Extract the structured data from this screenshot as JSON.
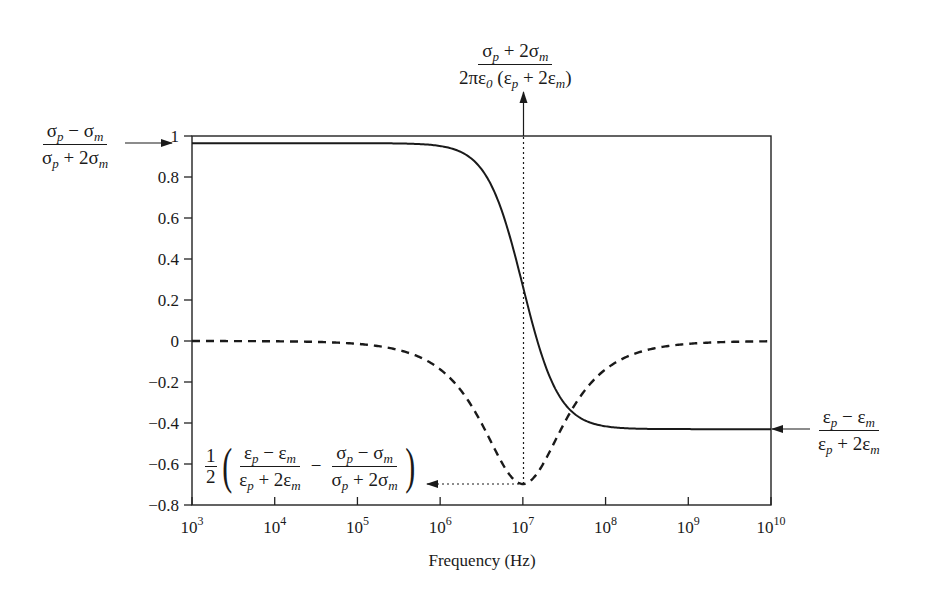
{
  "chart_data": {
    "type": "line",
    "title": "",
    "xlabel": "Frequency (Hz)",
    "ylabel": "",
    "xscale": "log",
    "xlim": [
      1000,
      10000000000
    ],
    "ylim": [
      -0.8,
      1.0
    ],
    "grid": false,
    "legend": null,
    "x_ticks": [
      "10^3",
      "10^4",
      "10^5",
      "10^6",
      "10^7",
      "10^8",
      "10^9",
      "10^10"
    ],
    "y_ticks": [
      "1",
      "0.8",
      "0.6",
      "0.4",
      "0.2",
      "0",
      "-0.2",
      "-0.4",
      "-0.6",
      "-0.8"
    ],
    "series": [
      {
        "name": "Real part (solid)",
        "style": "solid",
        "model": {
          "K_low": 0.965,
          "K_high": -0.43,
          "f_crossover": 10000000
        },
        "x": [
          1000,
          10000,
          100000,
          1000000,
          3000000,
          5000000,
          10000000,
          20000000,
          50000000,
          100000000,
          1000000000,
          10000000000
        ],
        "values": [
          0.965,
          0.965,
          0.965,
          0.951,
          0.85,
          0.69,
          0.27,
          -0.15,
          -0.376,
          -0.416,
          -0.43,
          -0.43
        ]
      },
      {
        "name": "Imaginary part (dashed)",
        "style": "dashed",
        "x": [
          1000,
          10000,
          100000,
          1000000,
          3000000,
          5000000,
          10000000,
          20000000,
          50000000,
          100000000,
          1000000000,
          10000000000
        ],
        "values": [
          0.0,
          -0.001,
          -0.014,
          -0.138,
          -0.384,
          -0.558,
          -0.7,
          -0.558,
          -0.268,
          -0.138,
          -0.014,
          -0.001
        ]
      }
    ],
    "annotations": [
      {
        "id": "low-freq-limit",
        "text": "(σp − σm) / (σp + 2σm)",
        "points_to": {
          "x": 1000,
          "y": 1.0
        }
      },
      {
        "id": "crossover-frequency",
        "text": "(σp + 2σm) / (2πε0 (εp + 2εm))",
        "points_to": {
          "x": 10000000,
          "y": "top"
        }
      },
      {
        "id": "high-freq-limit",
        "text": "(εp − εm) / (εp + 2εm)",
        "points_to": {
          "x": 10000000000,
          "y": -0.43
        }
      },
      {
        "id": "imag-minimum",
        "text": "1/2 ((εp − εm)/(εp + 2εm) − (σp − σm)/(σp + 2σm))",
        "points_to": {
          "x": 10000000,
          "y": -0.7
        }
      }
    ]
  },
  "labels": {
    "xlabel": "Frequency (Hz)",
    "y_ticks": [
      "1",
      "0.8",
      "0.6",
      "0.4",
      "0.2",
      "0",
      "−0.2",
      "−0.4",
      "−0.6",
      "−0.8"
    ],
    "x_ticks": [
      {
        "base": "10",
        "exp": "3"
      },
      {
        "base": "10",
        "exp": "4"
      },
      {
        "base": "10",
        "exp": "5"
      },
      {
        "base": "10",
        "exp": "6"
      },
      {
        "base": "10",
        "exp": "7"
      },
      {
        "base": "10",
        "exp": "8"
      },
      {
        "base": "10",
        "exp": "9"
      },
      {
        "base": "10",
        "exp": "10"
      }
    ],
    "ann_low": {
      "num_a": "σ",
      "num_a_sub": "p",
      "num_op": " − σ",
      "num_b_sub": "m",
      "den_a": "σ",
      "den_a_sub": "p",
      "den_op": " + 2σ",
      "den_b_sub": "m"
    },
    "ann_top": {
      "num_a": "σ",
      "num_a_sub": "p",
      "num_op": " + 2σ",
      "num_b_sub": "m",
      "den_pre": "2πε",
      "den_pre_sub": "0",
      "den_mid": " (ε",
      "den_mid_sub": "p",
      "den_op": " + 2ε",
      "den_op_sub": "m",
      "den_end": ")"
    },
    "ann_high": {
      "num_a": "ε",
      "num_a_sub": "p",
      "num_op": " − ε",
      "num_b_sub": "m",
      "den_a": "ε",
      "den_a_sub": "p",
      "den_op": " + 2ε",
      "den_b_sub": "m"
    },
    "ann_min": {
      "half_num": "1",
      "half_den": "2",
      "minus": "−",
      "f1_num_a": "ε",
      "f1_num_a_sub": "p",
      "f1_num_op": " − ε",
      "f1_num_b_sub": "m",
      "f1_den_a": "ε",
      "f1_den_a_sub": "p",
      "f1_den_op": " + 2ε",
      "f1_den_b_sub": "m",
      "f2_num_a": "σ",
      "f2_num_a_sub": "p",
      "f2_num_op": " − σ",
      "f2_num_b_sub": "m",
      "f2_den_a": "σ",
      "f2_den_a_sub": "p",
      "f2_den_op": " + 2σ",
      "f2_den_b_sub": "m"
    }
  },
  "colors": {
    "line": "#1a1a1a",
    "frame": "#222222",
    "background": "#ffffff"
  }
}
